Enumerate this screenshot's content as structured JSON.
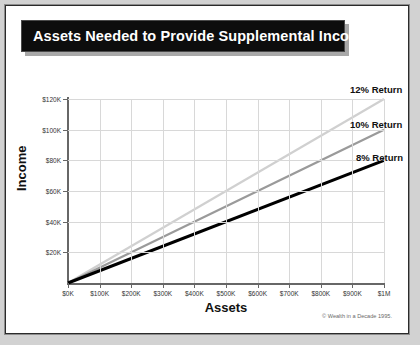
{
  "banner": {
    "title": "Assets Needed to Provide Supplemental Income"
  },
  "credit": "© Wealth in a Decade 1995.",
  "chart_data": {
    "type": "line",
    "title": "Assets Needed to Provide Supplemental Income",
    "xlabel": "Assets",
    "ylabel": "Income",
    "xlim": [
      0,
      1000000
    ],
    "ylim": [
      0,
      120000
    ],
    "grid": true,
    "legend_position": "inline-right",
    "x_tick_labels": [
      "$0K",
      "$100K",
      "$200K",
      "$300K",
      "$400K",
      "$500K",
      "$600K",
      "$700K",
      "$800K",
      "$900K",
      "$1M"
    ],
    "x_tick_values": [
      0,
      100000,
      200000,
      300000,
      400000,
      500000,
      600000,
      700000,
      800000,
      900000,
      1000000
    ],
    "y_tick_labels": [
      "$20K",
      "$40K",
      "$60K",
      "$80K",
      "$100K",
      "$120K"
    ],
    "y_tick_values": [
      20000,
      40000,
      60000,
      80000,
      100000,
      120000
    ],
    "x": [
      0,
      1000000
    ],
    "series": [
      {
        "name": "12% Return",
        "rate": 0.12,
        "values": [
          0,
          120000
        ],
        "color": "#d0d0d0"
      },
      {
        "name": "10% Return",
        "rate": 0.1,
        "values": [
          0,
          100000
        ],
        "color": "#9a9a9a"
      },
      {
        "name": "8% Return",
        "rate": 0.08,
        "values": [
          0,
          80000
        ],
        "color": "#000000"
      }
    ]
  },
  "colors": {
    "banner_bg": "#0d0d0d",
    "banner_text": "#ffffff",
    "grid": "#d8d8d8",
    "axis": "#676767",
    "card": "#ffffff",
    "page": "#d2d2d2"
  }
}
